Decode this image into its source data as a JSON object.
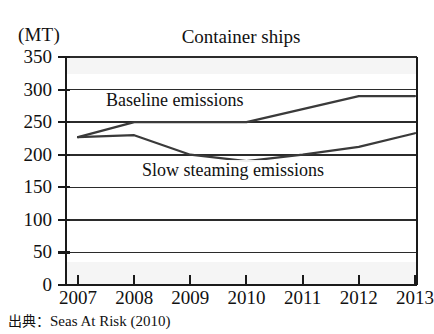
{
  "figure": {
    "title": "Container ships",
    "unit_label": "(MT)",
    "source_prefix": "出典",
    "source_separator": "：",
    "source_text": "Seas At Risk (2010)",
    "line_color": "#3a3a3a",
    "axis_color": "#1a1a1a",
    "grid_color": "#2b2b2b",
    "background": "#ffffff"
  },
  "labels": {
    "baseline": "Baseline emissions",
    "slow": "Slow steaming emissions"
  },
  "chart_data": {
    "type": "line",
    "title": "Container ships",
    "xlabel": "",
    "ylabel": "(MT)",
    "ylim": [
      0,
      350
    ],
    "yticks": [
      0,
      50,
      100,
      150,
      200,
      250,
      300,
      350
    ],
    "ytick_labels": [
      "0",
      "50",
      "100",
      "150",
      "200",
      "250",
      "300",
      "350"
    ],
    "x": [
      2007,
      2008,
      2009,
      2010,
      2011,
      2012,
      2013
    ],
    "xtick_labels": [
      "2007",
      "2008",
      "2009",
      "2010",
      "2011",
      "2012",
      "2013"
    ],
    "grid": true,
    "legend": "inline-annotation",
    "series": [
      {
        "name": "Baseline emissions",
        "values": [
          227,
          250,
          250,
          250,
          270,
          290,
          290
        ]
      },
      {
        "name": "Slow steaming emissions",
        "values": [
          227,
          230,
          200,
          190,
          200,
          212,
          233
        ]
      }
    ],
    "annotations": [
      {
        "text": "Baseline emissions",
        "x": 2008.1,
        "y": 272
      },
      {
        "text": "Slow steaming emissions",
        "x": 2009.3,
        "y": 167
      }
    ],
    "source": "出典：Seas At Risk (2010)"
  }
}
